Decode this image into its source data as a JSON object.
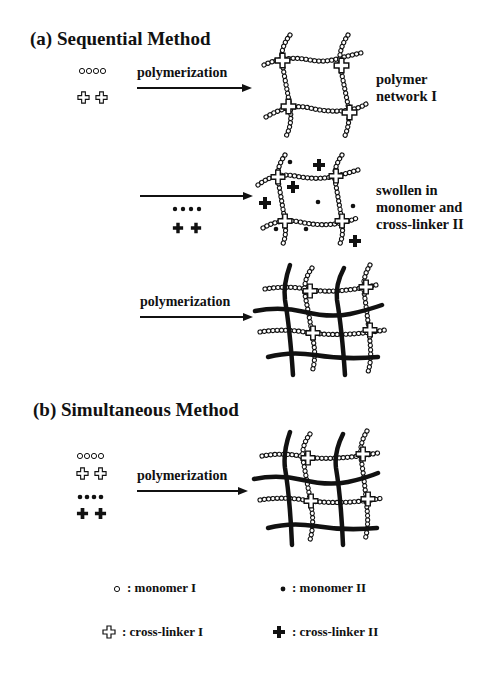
{
  "sections": {
    "a": {
      "heading": "(a) Sequential Method",
      "step1": {
        "arrow_label": "polymerization",
        "result_line1": "polymer",
        "result_line2": "network I"
      },
      "step2": {
        "arrow_label": "",
        "result_line1": "swollen in",
        "result_line2": "monomer and",
        "result_line3": "cross-linker II"
      },
      "step3": {
        "arrow_label": "polymerization"
      }
    },
    "b": {
      "heading": "(b) Simultaneous Method",
      "step1": {
        "arrow_label": "polymerization"
      }
    }
  },
  "legend": {
    "monomer_1": ": monomer I",
    "monomer_2": ": monomer II",
    "crosslinker_1": ": cross-linker I",
    "crosslinker_2": ": cross-linker II"
  },
  "colors": {
    "ink": "#111111",
    "background": "#ffffff"
  }
}
